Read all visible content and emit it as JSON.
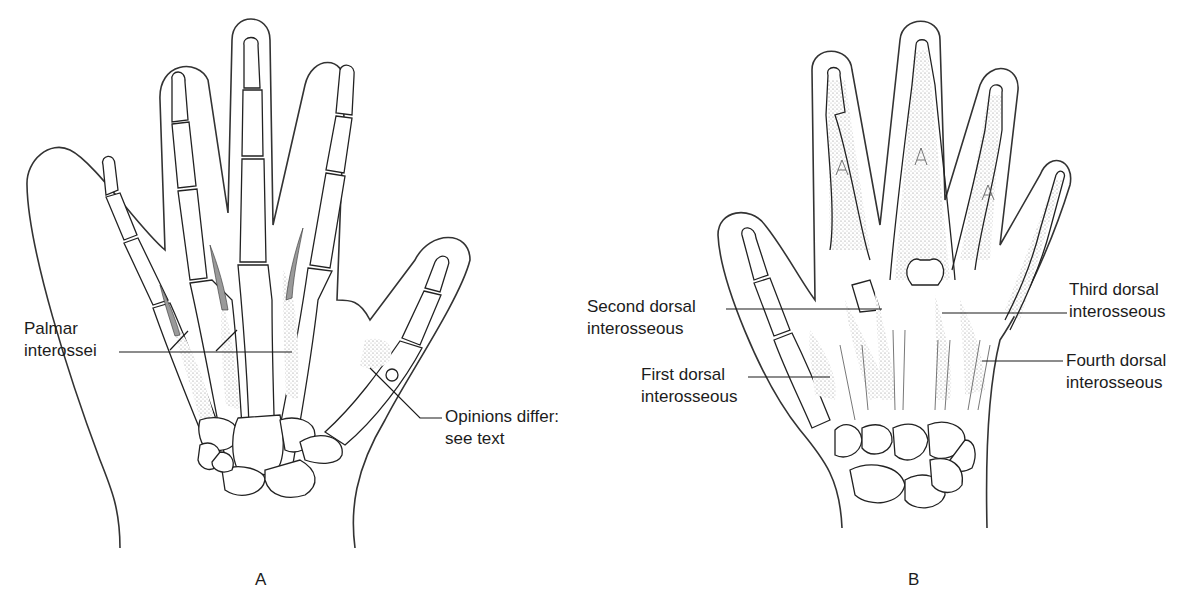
{
  "figure": {
    "panels": [
      {
        "letter": "A",
        "view": "palmar",
        "labels": [
          {
            "id": "palmar-interossei",
            "lines": [
              "Palmar",
              "interossei"
            ]
          },
          {
            "id": "opinions-differ",
            "lines": [
              "Opinions differ:",
              "see text"
            ]
          }
        ]
      },
      {
        "letter": "B",
        "view": "dorsal",
        "labels": [
          {
            "id": "second-dorsal-interosseous",
            "lines": [
              "Second dorsal",
              "interosseous"
            ]
          },
          {
            "id": "first-dorsal-interosseous",
            "lines": [
              "First dorsal",
              "interosseous"
            ]
          },
          {
            "id": "third-dorsal-interosseous",
            "lines": [
              "Third dorsal",
              "interosseous"
            ]
          },
          {
            "id": "fourth-dorsal-interosseous",
            "lines": [
              "Fourth dorsal",
              "interosseous"
            ]
          }
        ]
      }
    ]
  },
  "colors": {
    "background": "#ffffff",
    "line": "#222222",
    "stipple": "#9a9a9a"
  }
}
